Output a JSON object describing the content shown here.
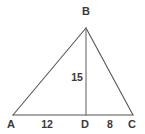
{
  "figure": {
    "type": "geometry-diagram",
    "shape": "triangle-with-altitude",
    "background_color": "#ffffff",
    "stroke_color": "#555555",
    "label_color": "#3a3a3a",
    "stroke_width": 1,
    "canvas": {
      "width": 145,
      "height": 134
    }
  },
  "vertices": [
    {
      "name": "B",
      "label": "B",
      "x": 86,
      "y": 28,
      "label_x": 86,
      "label_y": 11
    },
    {
      "name": "A",
      "label": "A",
      "x": 13,
      "y": 115,
      "label_x": 11,
      "label_y": 124
    },
    {
      "name": "D",
      "label": "D",
      "x": 86,
      "y": 115,
      "label_x": 85,
      "label_y": 124
    },
    {
      "name": "C",
      "label": "C",
      "x": 133,
      "y": 115,
      "label_x": 132,
      "label_y": 124
    }
  ],
  "segments": [
    {
      "name": "side-AB",
      "from": "A",
      "to": "B"
    },
    {
      "name": "side-BC",
      "from": "B",
      "to": "C"
    },
    {
      "name": "base-AC",
      "from": "A",
      "to": "C"
    },
    {
      "name": "altitude-BD",
      "from": "B",
      "to": "D"
    }
  ],
  "measurements": [
    {
      "name": "segment-AD-length",
      "value": "12",
      "x": 47,
      "y": 124,
      "segment": "AD"
    },
    {
      "name": "segment-DC-length",
      "value": "8",
      "x": 110,
      "y": 124,
      "segment": "DC"
    },
    {
      "name": "altitude-BD-length",
      "value": "15",
      "x": 77,
      "y": 77,
      "segment": "BD"
    }
  ]
}
